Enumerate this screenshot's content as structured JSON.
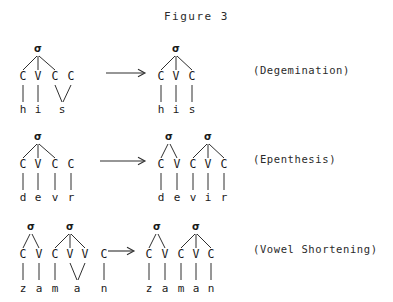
{
  "figure": {
    "title": "Figure 3",
    "sigma_symbol": "σ"
  },
  "rows": [
    {
      "id": "degemination",
      "label": "(Degemination)",
      "arrow": "→",
      "input": {
        "slots": [
          "C",
          "V",
          "C",
          "C"
        ],
        "segments": [
          "h",
          "i",
          "s"
        ],
        "word": "his",
        "syllables": [
          {
            "sigma": "σ",
            "covers": [
              0,
              1,
              2
            ]
          }
        ],
        "note": "geminate: final two C slots share one segment s"
      },
      "output": {
        "slots": [
          "C",
          "V",
          "C"
        ],
        "segments": [
          "h",
          "i",
          "s"
        ],
        "word": "his",
        "syllables": [
          {
            "sigma": "σ",
            "covers": [
              0,
              1,
              2
            ]
          }
        ],
        "note": "single C; gemination resolved"
      }
    },
    {
      "id": "epenthesis",
      "label": "(Epenthesis)",
      "arrow": "→",
      "input": {
        "slots": [
          "C",
          "V",
          "C",
          "C"
        ],
        "segments": [
          "d",
          "e",
          "v",
          "r"
        ],
        "word": "devr",
        "syllables": [
          {
            "sigma": "σ",
            "covers": [
              0,
              1,
              2
            ]
          }
        ],
        "note": "final C is extrasyllabic"
      },
      "output": {
        "slots": [
          "C",
          "V",
          "C",
          "V",
          "C"
        ],
        "segments": [
          "d",
          "e",
          "v",
          "i",
          "r"
        ],
        "word": "devir",
        "syllables": [
          {
            "sigma": "σ",
            "covers": [
              0,
              1
            ]
          },
          {
            "sigma": "σ",
            "covers": [
              2,
              3,
              4
            ]
          }
        ],
        "note": "epenthetic vowel i inserted"
      }
    },
    {
      "id": "vowel-shortening",
      "label": "(Vowel Shortening)",
      "arrow": "→",
      "input": {
        "slots": [
          "C",
          "V",
          "C",
          "V",
          "V",
          "C"
        ],
        "segments": [
          "z",
          "a",
          "m",
          "a",
          "n"
        ],
        "word": "zaman",
        "syllables": [
          {
            "sigma": "σ",
            "covers": [
              0,
              1
            ]
          },
          {
            "sigma": "σ",
            "covers": [
              2,
              3,
              4
            ]
          }
        ],
        "note": "long vowel: two V slots share segment a; final C extrasyllabic"
      },
      "output": {
        "slots": [
          "C",
          "V",
          "C",
          "V",
          "C"
        ],
        "segments": [
          "z",
          "a",
          "m",
          "a",
          "n"
        ],
        "word": "zaman",
        "syllables": [
          {
            "sigma": "σ",
            "covers": [
              0,
              1
            ]
          },
          {
            "sigma": "σ",
            "covers": [
              2,
              3,
              4
            ]
          }
        ],
        "note": "vowel shortened to single V; final C syllabified"
      }
    }
  ],
  "colors": {
    "background": "#ffffff",
    "ink": "#1a1a1a",
    "line": "#2f2f2f"
  }
}
